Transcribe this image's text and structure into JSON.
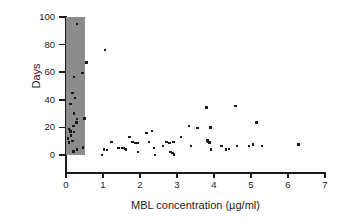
{
  "chart_data": {
    "type": "scatter",
    "title": "",
    "xlabel": "MBL concentration (µg/ml)",
    "ylabel": "Days",
    "xlim": [
      0,
      7
    ],
    "ylim": [
      0,
      100
    ],
    "xticks": [
      0,
      1,
      2,
      3,
      4,
      5,
      6,
      7
    ],
    "yticks": [
      0,
      20,
      40,
      60,
      80,
      100
    ],
    "grid": false,
    "legend": null,
    "marker": "square",
    "marker_color": "#1a1a1a",
    "shaded_region": {
      "label": "MBL deficiency band",
      "x_start": 0,
      "x_end": 0.5,
      "color": "#8c8c8c"
    },
    "points": [
      [
        0.3,
        95.0
      ],
      [
        0.55,
        67.0
      ],
      [
        1.05,
        76.0
      ],
      [
        0.45,
        59.5
      ],
      [
        0.22,
        56.5
      ],
      [
        0.18,
        45.0
      ],
      [
        0.25,
        41.5
      ],
      [
        0.12,
        37.0
      ],
      [
        0.22,
        30.0
      ],
      [
        0.5,
        26.5
      ],
      [
        0.3,
        26.0
      ],
      [
        0.28,
        23.5
      ],
      [
        0.2,
        21.0
      ],
      [
        0.08,
        19.0
      ],
      [
        0.1,
        18.0
      ],
      [
        0.12,
        17.0
      ],
      [
        0.22,
        16.5
      ],
      [
        0.14,
        14.0
      ],
      [
        0.05,
        12.0
      ],
      [
        0.18,
        10.0
      ],
      [
        0.08,
        9.0
      ],
      [
        0.46,
        5.5
      ],
      [
        0.3,
        4.0
      ],
      [
        0.2,
        2.5
      ],
      [
        0.97,
        0.0
      ],
      [
        1.03,
        4.0
      ],
      [
        1.1,
        3.5
      ],
      [
        1.23,
        9.5
      ],
      [
        1.42,
        5.0
      ],
      [
        1.52,
        5.0
      ],
      [
        1.57,
        5.0
      ],
      [
        1.6,
        4.5
      ],
      [
        1.62,
        4.0
      ],
      [
        1.72,
        13.0
      ],
      [
        1.8,
        9.5
      ],
      [
        1.88,
        8.5
      ],
      [
        1.93,
        8.5
      ],
      [
        1.95,
        2.0
      ],
      [
        2.18,
        16.0
      ],
      [
        2.25,
        9.5
      ],
      [
        2.32,
        17.5
      ],
      [
        2.37,
        5.0
      ],
      [
        2.4,
        0.0
      ],
      [
        2.62,
        6.5
      ],
      [
        2.72,
        9.5
      ],
      [
        2.8,
        8.5
      ],
      [
        2.82,
        2.0
      ],
      [
        2.88,
        1.5
      ],
      [
        2.9,
        9.5
      ],
      [
        2.92,
        0.5
      ],
      [
        3.1,
        13.0
      ],
      [
        3.33,
        21.0
      ],
      [
        3.38,
        6.5
      ],
      [
        3.55,
        19.5
      ],
      [
        3.8,
        34.5
      ],
      [
        3.82,
        10.5
      ],
      [
        3.85,
        9.5
      ],
      [
        3.88,
        9.0
      ],
      [
        3.9,
        20.0
      ],
      [
        3.92,
        4.0
      ],
      [
        4.2,
        6.5
      ],
      [
        4.32,
        4.0
      ],
      [
        4.4,
        4.5
      ],
      [
        4.58,
        35.5
      ],
      [
        4.62,
        6.5
      ],
      [
        4.95,
        6.5
      ],
      [
        5.05,
        7.5
      ],
      [
        5.15,
        23.5
      ],
      [
        5.3,
        6.5
      ],
      [
        6.28,
        7.5
      ]
    ]
  },
  "axis": {
    "y_tick_labels": [
      "0",
      "20",
      "40",
      "60",
      "80",
      "100"
    ],
    "x_tick_labels": [
      "0",
      "1",
      "2",
      "3",
      "4",
      "5",
      "6",
      "7"
    ]
  }
}
